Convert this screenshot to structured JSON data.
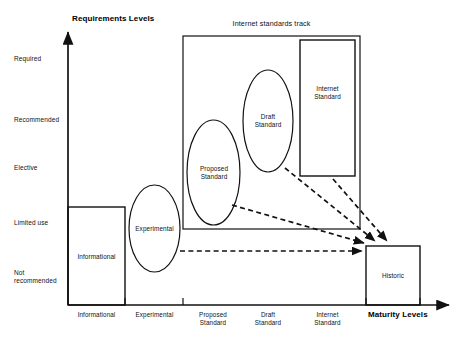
{
  "figure": {
    "y_axis_title": "Requirements Levels",
    "x_axis_title": "Maturity Levels",
    "group_title": "Internet standards track"
  },
  "y_axis": {
    "levels": [
      {
        "label": "Required"
      },
      {
        "label": "Recommended"
      },
      {
        "label": "Elective"
      },
      {
        "label": "Limited use"
      },
      {
        "label": "Not\nrecommended"
      }
    ]
  },
  "x_axis": {
    "ticks": [
      {
        "label": "Informational"
      },
      {
        "label": "Experimental"
      },
      {
        "label": "Proposed\nStandard"
      },
      {
        "label": "Draft\nStandard"
      },
      {
        "label": "Internet\nStandard"
      }
    ]
  },
  "nodes": [
    {
      "id": "informational",
      "label": "Informational",
      "shape": "rect"
    },
    {
      "id": "experimental",
      "label": "Experimental",
      "shape": "ellipse"
    },
    {
      "id": "proposed-standard",
      "label": "Proposed\nStandard",
      "shape": "ellipse"
    },
    {
      "id": "draft-standard",
      "label": "Draft\nStandard",
      "shape": "ellipse"
    },
    {
      "id": "internet-standard",
      "label": "Internet\nStandard",
      "shape": "rect"
    },
    {
      "id": "historic",
      "label": "Historic",
      "shape": "rect"
    }
  ],
  "edges": [
    {
      "from": "experimental",
      "to": "historic",
      "style": "dashed-arrow"
    },
    {
      "from": "proposed-standard",
      "to": "historic",
      "style": "dashed-arrow"
    },
    {
      "from": "draft-standard",
      "to": "historic",
      "style": "dashed-arrow"
    },
    {
      "from": "internet-standard",
      "to": "historic",
      "style": "dashed-arrow"
    }
  ],
  "style": {
    "stroke": "#111111",
    "background": "#ffffff"
  }
}
